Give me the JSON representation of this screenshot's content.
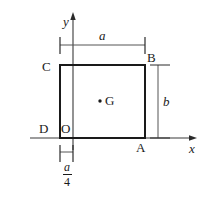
{
  "figure": {
    "background_color": "#ffffff",
    "line_color": "#1a1a1a",
    "axis_color": "#333333",
    "vertices": [
      {
        "name": "A",
        "label": "A",
        "x": 145,
        "y": 138,
        "label_x": 137,
        "label_y": 142
      },
      {
        "name": "B",
        "label": "B",
        "x": 145,
        "y": 65,
        "label_x": 147,
        "label_y": 52
      },
      {
        "name": "C",
        "label": "C",
        "x": 60,
        "y": 65,
        "label_x": 45,
        "label_y": 60
      },
      {
        "name": "D",
        "label": "D",
        "x": 60,
        "y": 138,
        "label_x": 42,
        "label_y": 123
      }
    ],
    "origin": {
      "name": "O",
      "label": "O",
      "x": 73,
      "y": 138,
      "label_x": 62,
      "label_y": 123
    },
    "centroid": {
      "name": "G",
      "label": "G",
      "dot_x": 100,
      "dot_y": 101,
      "label_x": 105,
      "label_y": 94
    },
    "axes": {
      "x_label": "x",
      "y_label": "y",
      "x_label_x": 190,
      "x_label_y": 142,
      "y_label_x": 64,
      "y_label_y": 16
    },
    "dimensions": [
      {
        "name": "width",
        "label": "a",
        "orientation": "horizontal",
        "from": 60,
        "to": 145,
        "at": 45,
        "label_x": 99,
        "label_y": 29
      },
      {
        "name": "height",
        "label": "b",
        "orientation": "vertical",
        "from": 65,
        "to": 138,
        "at": 158,
        "label_x": 163,
        "label_y": 95
      },
      {
        "name": "offset",
        "numerator": "a",
        "denominator": "4",
        "orientation": "horizontal",
        "from": 60,
        "to": 73,
        "at": 152,
        "label_x": 58,
        "label_y": 161
      }
    ]
  }
}
